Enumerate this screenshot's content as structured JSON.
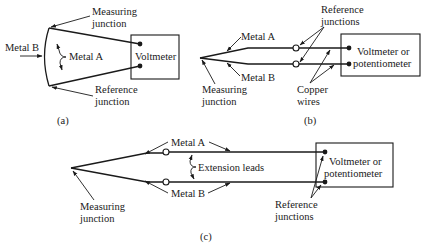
{
  "figure": {
    "panel_a": {
      "caption": "(a)",
      "labels": {
        "measuring_junction_1": "Measuring",
        "measuring_junction_2": "junction",
        "metal_b": "Metal B",
        "metal_a": "Metal A",
        "instrument": "Voltmeter",
        "reference_junction_1": "Reference",
        "reference_junction_2": "junction"
      }
    },
    "panel_b": {
      "caption": "(b)",
      "labels": {
        "reference_junctions_1": "Reference",
        "reference_junctions_2": "junctions",
        "metal_a": "Metal A",
        "metal_b": "Metal B",
        "instrument_1": "Voltmeter or",
        "instrument_2": "potentiometer",
        "measuring_junction_1": "Measuring",
        "measuring_junction_2": "junction",
        "copper_wires_1": "Copper",
        "copper_wires_2": "wires"
      }
    },
    "panel_c": {
      "caption": "(c)",
      "labels": {
        "metal_a": "Metal A",
        "extension_leads": "Extension leads",
        "metal_b": "Metal B",
        "instrument_1": "Voltmeter or",
        "instrument_2": "potentiometer",
        "measuring_junction_1": "Measuring",
        "measuring_junction_2": "junction",
        "reference_junctions_1": "Reference",
        "reference_junctions_2": "junctions"
      }
    }
  },
  "colors": {
    "ink": "#1a1a1a",
    "background": "#ffffff"
  }
}
